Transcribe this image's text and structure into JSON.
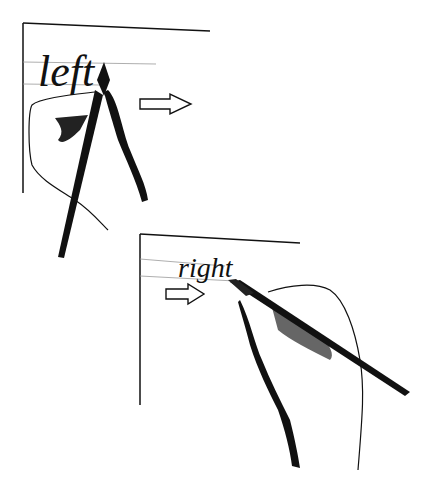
{
  "illustration": {
    "top_panel": {
      "word": "left",
      "arrow_direction": "right",
      "icon": "arrow-right-outline-icon"
    },
    "bottom_panel": {
      "word": "right",
      "arrow_direction": "right",
      "icon": "arrow-right-outline-icon"
    },
    "colors": {
      "ink": "#111111",
      "guideline": "#999999",
      "paper": "#ffffff"
    }
  }
}
